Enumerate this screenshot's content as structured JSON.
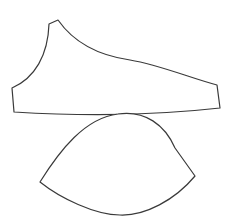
{
  "diagram": {
    "width": 234,
    "height": 224,
    "background": "#ffffff",
    "stroke_color": "#3a3a3a",
    "shapes": [
      {
        "name": "upper-pattern-piece",
        "path": "M 49 24 L 58 20 C 72 40, 95 55, 130 60 C 160 65, 190 78, 217 85 L 220 108 C 150 116, 80 116, 14 112 L 12 88 C 35 78, 48 55, 49 24 Z"
      },
      {
        "name": "lower-lens-piece",
        "path": "M 118 114 C 145 110, 165 125, 175 148 L 195 176 C 175 200, 145 216, 120 215 C 95 215, 60 198, 40 182 C 60 150, 85 118, 118 114 Z"
      }
    ]
  }
}
